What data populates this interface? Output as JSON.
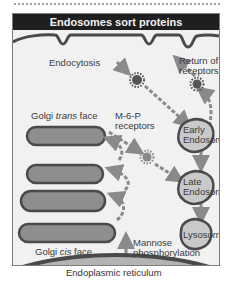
{
  "title": "Endosomes sort proteins",
  "labels": {
    "endocytosis": "Endocytosis",
    "return_line1": "Return of",
    "return_line2": "receptors",
    "golgi_trans_prefix": "Golgi ",
    "golgi_trans_italic": "trans",
    "golgi_trans_suffix": " face",
    "m6p_line1": "M-6-P",
    "m6p_line2": "receptors",
    "early_line1": "Early",
    "early_line2": "Endosome",
    "late_line1": "Late",
    "late_line2": "Endosome",
    "lysosome": "Lysosome",
    "golgi_cis_prefix": "Golgi ",
    "golgi_cis_italic": "cis",
    "golgi_cis_suffix": " face",
    "mannose_line1": "Mannose",
    "mannose_line2": "phosphorylation",
    "er": "Endoplasmic reticulum"
  },
  "colors": {
    "title_bg": "#1f1f1f",
    "panel_bg": "#f1f1f1",
    "membrane": "#4a4a4a",
    "organelle_fill": "#8e8e8e",
    "endosome_fill": "#c9c9c9",
    "er_fill": "#b3b3b3",
    "arrow": "#8a8a8a",
    "receptor": "#555555"
  }
}
